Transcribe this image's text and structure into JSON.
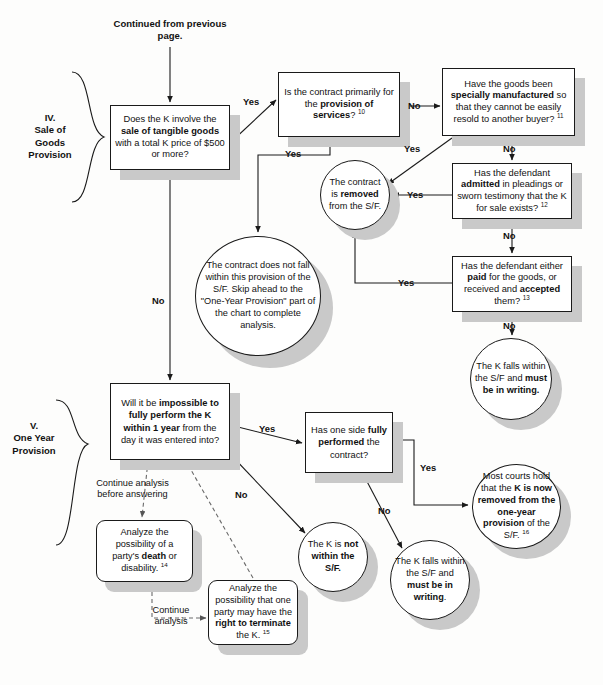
{
  "page": {
    "header": "Continued from previous page.",
    "background": "#fdfdfc",
    "line_color": "#1a1a1a",
    "shadow_color": "#c9c9c9"
  },
  "sections": [
    {
      "id": "sale-of-goods",
      "label": "IV.\nSale of\nGoods\nProvision"
    },
    {
      "id": "one-year",
      "label": "V.\nOne Year\nProvision"
    }
  ],
  "nodes": {
    "q_sale_goods": {
      "shape": "rect",
      "text_html": "Does the K involve the <b>sale of tangible goods</b> with a total K price of $500 or more?"
    },
    "q_services": {
      "shape": "rect",
      "text_html": "Is the contract primarily for the <b>provision of services</b>? <sup>10</sup>"
    },
    "q_specially_manufactured": {
      "shape": "rect",
      "text_html": "Have the goods been <b>specially manufactured</b> so that they cannot be easily resold to another buyer? <sup>11</sup>"
    },
    "q_admitted": {
      "shape": "rect",
      "text_html": "Has the defendant <b>admitted</b> in pleadings or sworn testimony that the K for sale exists? <sup>12</sup>"
    },
    "q_paid_accepted": {
      "shape": "rect",
      "text_html": "Has the defendant either <b>paid</b> for the goods, or received and <b>accepted</b> them? <sup>13</sup>"
    },
    "r_removed": {
      "shape": "ellipse",
      "text_html": "The contract is <b>removed</b> from the S/F."
    },
    "r_not_within_provision": {
      "shape": "ellipse",
      "text_html": "The contract does not fall within this provision of the S/F. Skip ahead to the \"One-Year Provision\" part of the chart to complete analysis."
    },
    "r_falls_within_writing_1": {
      "shape": "ellipse",
      "text_html": "The K falls within the S/F and <b>must be in writing.</b>"
    },
    "q_impossible_one_year": {
      "shape": "rect",
      "text_html": "Will it be <b>impossible to fully perform the K within 1 year</b> from the day it was entered into?"
    },
    "q_fully_performed": {
      "shape": "rect",
      "text_html": "Has one side <b>fully performed</b> the contract?"
    },
    "r_most_courts": {
      "shape": "ellipse",
      "text_html": "Most courts hold that the <b>K is now removed from the one-year provision</b> of the S/F. <sup>16</sup>"
    },
    "r_not_within_sf": {
      "shape": "ellipse",
      "text_html": "The K is <b>not within the S/F.</b>"
    },
    "r_falls_within_writing_2": {
      "shape": "ellipse",
      "text_html": "The K falls within the S/F and <b>must be in writing</b>."
    },
    "n_death_disability": {
      "shape": "rounded",
      "text_html": "Analyze the possibility of a party's <b>death</b> or disability. <sup>14</sup>"
    },
    "n_right_terminate": {
      "shape": "rounded",
      "text_html": "Analyze the possibility that one party may have the <b>right to terminate</b> the K. <sup>15</sup>"
    }
  },
  "edge_labels": {
    "goods_yes": "Yes",
    "goods_no": "No",
    "services_yes": "Yes",
    "services_no": "No",
    "specially_yes": "Yes",
    "specially_no": "No",
    "admitted_yes": "Yes",
    "admitted_no": "No",
    "paid_yes": "Yes",
    "paid_no": "No",
    "oneyear_yes": "Yes",
    "oneyear_no": "No",
    "performed_yes": "Yes",
    "performed_no": "No",
    "continue_before_answering": "Continue analysis\nbefore answering",
    "continue_analysis": "Continue\nanalysis"
  }
}
